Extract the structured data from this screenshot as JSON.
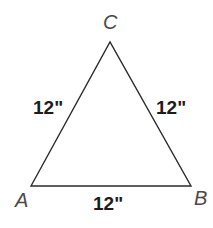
{
  "figure": {
    "type": "equilateral-triangle-diagram",
    "background_color": "#ffffff",
    "stroke_color": "#2b2b2b",
    "stroke_width": 1.4,
    "label_color_vertex": "#4a4a4a",
    "label_color_side": "#1c1c1c",
    "vertices": [
      {
        "id": "A",
        "label": "A",
        "x": 31,
        "y": 186
      },
      {
        "id": "B",
        "label": "B",
        "x": 191,
        "y": 186
      },
      {
        "id": "C",
        "label": "C",
        "x": 110,
        "y": 42
      }
    ],
    "sides": [
      {
        "id": "AC",
        "label": "12\"",
        "from": "A",
        "to": "C"
      },
      {
        "id": "BC",
        "label": "12\"",
        "from": "B",
        "to": "C"
      },
      {
        "id": "AB",
        "label": "12\"",
        "from": "A",
        "to": "B"
      }
    ],
    "polygon_points": "31,186 110,42 191,186"
  }
}
